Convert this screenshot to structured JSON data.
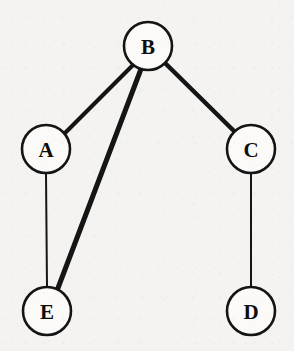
{
  "diagram": {
    "type": "node-link-graph",
    "canvas": {
      "width": 294,
      "height": 351,
      "background": "#f4f3f1"
    },
    "style": {
      "node_fill": "#fbfaf8",
      "node_stroke": "#141414",
      "node_radius": 24,
      "node_stroke_width": 2.6,
      "edge_color": "#151515",
      "label_color": "#0d0d0d"
    },
    "nodes": [
      {
        "id": "B",
        "label": "B",
        "cx": 148,
        "cy": 46,
        "r": 24
      },
      {
        "id": "A",
        "label": "A",
        "cx": 46,
        "cy": 149,
        "r": 24
      },
      {
        "id": "C",
        "label": "C",
        "cx": 251,
        "cy": 149,
        "r": 24
      },
      {
        "id": "E",
        "label": "E",
        "cx": 47,
        "cy": 311,
        "r": 24
      },
      {
        "id": "D",
        "label": "D",
        "cx": 251,
        "cy": 311,
        "r": 24
      }
    ],
    "edges": [
      {
        "id": "A-B",
        "from": "A",
        "to": "B",
        "x1": 64,
        "y1": 134,
        "x2": 134,
        "y2": 64,
        "width": 4.0
      },
      {
        "id": "B-E",
        "from": "B",
        "to": "E",
        "x1": 141,
        "y1": 69,
        "x2": 58,
        "y2": 288,
        "width": 5.0
      },
      {
        "id": "B-C",
        "from": "B",
        "to": "C",
        "x1": 165,
        "y1": 63,
        "x2": 236,
        "y2": 133,
        "width": 4.5
      },
      {
        "id": "A-E",
        "from": "A",
        "to": "E",
        "x1": 46,
        "y1": 173,
        "x2": 47,
        "y2": 287,
        "width": 2.0
      },
      {
        "id": "C-D",
        "from": "C",
        "to": "D",
        "x1": 251,
        "y1": 173,
        "x2": 251,
        "y2": 287,
        "width": 2.0
      }
    ]
  }
}
